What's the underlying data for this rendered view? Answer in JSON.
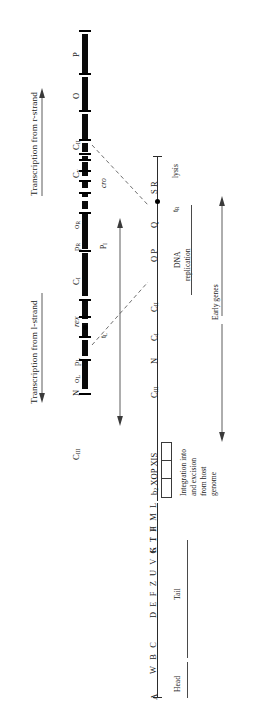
{
  "figure": {
    "type": "genetic-map",
    "orientation": "rotated-90-ccw"
  },
  "transcription": {
    "left_label": "Transcription from l-strand",
    "right_label": "Transcription from r-strand"
  },
  "chromosome_labels": {
    "cIII": "C",
    "cIII_sub": "III",
    "N": "N",
    "oL": "o",
    "oL_sub": "L",
    "pL": "p",
    "pL_sub": "L",
    "rex": "rex",
    "cI": "C",
    "cI_sub": "I",
    "pR": "p",
    "pR_sub": "R",
    "oR": "o",
    "oR_sub": "R",
    "cy": "C",
    "cy_sub": "y",
    "cII": "C",
    "cII_sub": "II",
    "O": "O",
    "P": "P",
    "cro": "cro",
    "pI": "P",
    "pI_sub": "I",
    "tL": "t",
    "tL_sub": "L"
  },
  "lower_map": {
    "left_genes": "b",
    "left_genes_sub": "2",
    "left_genes_rest": " XOP XIS",
    "integration_caption_line1": "Integration into",
    "integration_caption_line2": "and excision",
    "integration_caption_line3": "from host",
    "integration_caption_line4": "genome",
    "cIII": "C",
    "cIII_sub": "III",
    "N": "N",
    "cI": "C",
    "cI_sub": "I",
    "cII": "C",
    "cII_sub": "II",
    "OP": "O P",
    "Q": "Q",
    "SR": "S R",
    "tR": "t",
    "tR_sub": "R",
    "dna_replication_line1": "DNA",
    "dna_replication_line2": "replication",
    "lysis": "lysis",
    "early_genes": "Early genes"
  },
  "structural_map": {
    "head_genes_1": "A",
    "head_genes_2": "W B C",
    "tail_genes_1": "D E F Z U V G T H M L",
    "tail_genes_2": "K I J",
    "head_label": "Head",
    "tail_label": "Tail"
  },
  "colors": {
    "ink": "#1a1a1a",
    "bar": "#000000",
    "rule": "#4a4a4a",
    "background": "#ffffff"
  }
}
